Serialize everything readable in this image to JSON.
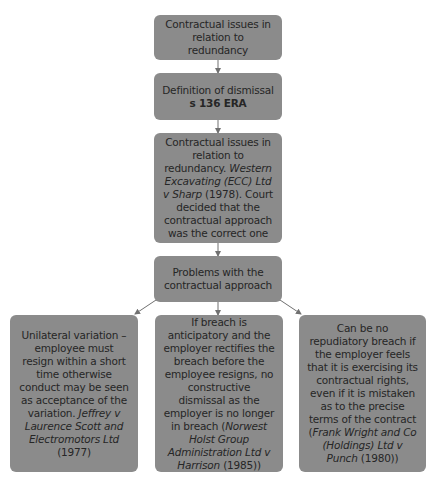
{
  "colors": {
    "box_fill": "#8b8b8b",
    "text": "#262626",
    "connector": "#707070",
    "background": "#ffffff"
  },
  "nodes": {
    "n1": {
      "text": "Contractual issues in relation to redundancy"
    },
    "n2": {
      "line1": "Definition of dismissal",
      "line2_bold": "s 136 ERA"
    },
    "n3": {
      "text_before": "Contractual issues in relation to redundancy. ",
      "case_italic": "Western Excavating (ECC) Ltd v Sharp",
      "text_after": " (1978). Court decided that the contractual approach was the correct one"
    },
    "n4": {
      "text": "Problems with the contractual approach"
    },
    "left": {
      "text_before": "Unilateral variation – employee must resign within a short time otherwise conduct may be seen as acceptance of the variation. ",
      "case_italic": "Jeffrey v Laurence Scott and Electromotors Ltd",
      "text_after": " (1977)"
    },
    "middle": {
      "text_before": "If breach is anticipatory and the employer rectifies the breach before the employee resigns, no constructive dismissal as the employer is no longer in breach (",
      "case_italic": "Norwest Holst Group Administration Ltd v Harrison",
      "text_after": " (1985))"
    },
    "right": {
      "text_before": "Can be no repudiatory breach if the employer feels that it is exercising its contractual rights, even if it is mistaken as to the precise terms of the contract (",
      "case_italic": "Frank Wright and Co (Holdings) Ltd v Punch",
      "text_after": " (1980))"
    }
  },
  "edges": [
    {
      "from": "n1",
      "to": "n2"
    },
    {
      "from": "n2",
      "to": "n3"
    },
    {
      "from": "n3",
      "to": "n4"
    },
    {
      "from": "n4",
      "to": "left"
    },
    {
      "from": "n4",
      "to": "middle"
    },
    {
      "from": "n4",
      "to": "right"
    }
  ]
}
